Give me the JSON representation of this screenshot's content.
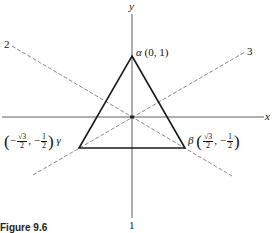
{
  "axes": {
    "x_label": "x",
    "y_label": "y"
  },
  "reflection_lines": [
    {
      "label": "1"
    },
    {
      "label": "2"
    },
    {
      "label": "3"
    }
  ],
  "vertices": {
    "alpha": {
      "greek": "α",
      "coords": "(0, 1)"
    },
    "beta": {
      "greek": "β",
      "x_num": "√3",
      "x_den": "2",
      "y_sign": "−",
      "y_num": "1",
      "y_den": "2"
    },
    "gamma": {
      "greek": "γ",
      "x_sign": "−",
      "x_num": "√3",
      "x_den": "2",
      "y_sign": "−",
      "y_num": "1",
      "y_den": "2"
    }
  },
  "caption": "Figure 9.6",
  "colors": {
    "triangle": "#1a1a1a",
    "axes": "#333333",
    "dashed": "#555555"
  }
}
